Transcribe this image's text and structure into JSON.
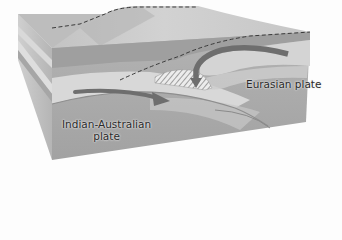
{
  "diagram": {
    "type": "block-diagram",
    "labels": {
      "eurasian_plate": "Eurasian plate",
      "indian_australian_plate": "Indian-Australian\nplate",
      "indian_australian_plate_line1": "Indian-Australian",
      "indian_australian_plate_line2": "plate"
    },
    "arrows": [
      {
        "name": "indian-plate-motion-arrow",
        "direction": "right",
        "meaning": "Indian-Australian plate moving toward Eurasian plate"
      },
      {
        "name": "eurasian-plate-downward-arrow",
        "direction": "down-curving",
        "meaning": "Eurasian plate material bending downward"
      }
    ],
    "features": {
      "dashed_lines": "plate boundary outlines on surface and in cross-section",
      "hatched_region": "compressed crust wedge at collision zone"
    },
    "colors": {
      "background": "#fdfdfd",
      "block_top": "#c9c9c9",
      "block_front": "#a9a9a9",
      "block_side": "#bdbdbd",
      "light_layer": "#d6d6d6",
      "arrow": "#6e6e6e",
      "dashed_line": "#3a3a3a",
      "text": "#2a2a2a"
    }
  }
}
